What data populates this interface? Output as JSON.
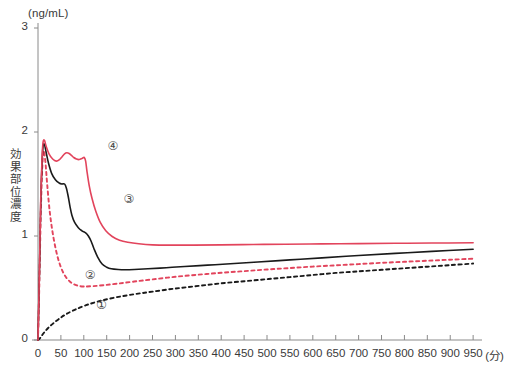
{
  "chart_data": {
    "type": "line",
    "title": "",
    "xlabel": "(分)",
    "ylabel": "効果部位濃度",
    "yunit": "(ng/mL)",
    "xlim": [
      0,
      965
    ],
    "ylim": [
      0,
      3
    ],
    "grid": false,
    "legend_position": "inline-annotations",
    "xticks": [
      0,
      50,
      100,
      150,
      200,
      250,
      300,
      350,
      400,
      450,
      500,
      550,
      600,
      650,
      700,
      750,
      800,
      850,
      900,
      950
    ],
    "xtick_labels": [
      "0",
      "50",
      "100",
      "150",
      "200",
      "250",
      "300",
      "350",
      "400",
      "450",
      "500",
      "550",
      "600",
      "650",
      "700",
      "750",
      "800",
      "850",
      "900",
      "950"
    ],
    "yticks": [
      0,
      1,
      2,
      3
    ],
    "ytick_labels": [
      "0",
      "1",
      "2",
      "3"
    ],
    "colors": {
      "red": "#e2445c",
      "black": "#1a1a1a",
      "axis": "#8a8a8a",
      "text": "#3a3a3a"
    },
    "series": [
      {
        "name": "1",
        "label": "①",
        "color": "#1a1a1a",
        "style": "dashed",
        "label_x": 140,
        "label_y": 0.33,
        "x": [
          0,
          4,
          8,
          14,
          22,
          32,
          45,
          60,
          80,
          105,
          135,
          170,
          210,
          250,
          300,
          350,
          400,
          450,
          500,
          550,
          600,
          650,
          700,
          750,
          800,
          850,
          900,
          950
        ],
        "y": [
          0.0,
          0.015,
          0.04,
          0.075,
          0.115,
          0.155,
          0.2,
          0.245,
          0.29,
          0.335,
          0.375,
          0.41,
          0.44,
          0.465,
          0.495,
          0.52,
          0.545,
          0.565,
          0.585,
          0.605,
          0.625,
          0.645,
          0.66,
          0.675,
          0.69,
          0.705,
          0.72,
          0.735
        ]
      },
      {
        "name": "2",
        "label": "②",
        "color": "#e2445c",
        "style": "dashed",
        "label_x": 115,
        "label_y": 0.62,
        "x": [
          0,
          3,
          6,
          9,
          12,
          16,
          20,
          26,
          34,
          44,
          56,
          70,
          85,
          100,
          120,
          145,
          175,
          210,
          250,
          300,
          350,
          400,
          450,
          500,
          550,
          600,
          650,
          700,
          750,
          800,
          850,
          900,
          950
        ],
        "y": [
          0.0,
          0.55,
          1.2,
          1.62,
          1.82,
          1.72,
          1.5,
          1.22,
          0.98,
          0.78,
          0.64,
          0.56,
          0.525,
          0.515,
          0.518,
          0.528,
          0.543,
          0.562,
          0.583,
          0.608,
          0.628,
          0.646,
          0.662,
          0.678,
          0.692,
          0.706,
          0.718,
          0.73,
          0.742,
          0.752,
          0.762,
          0.772,
          0.782
        ]
      },
      {
        "name": "3",
        "label": "③",
        "color": "#1a1a1a",
        "style": "solid",
        "label_x": 200,
        "label_y": 1.35,
        "x": [
          0,
          3,
          6,
          9,
          11,
          14,
          18,
          23,
          30,
          38,
          46,
          52,
          58,
          62,
          66,
          70,
          74,
          80,
          88,
          96,
          104,
          110,
          116,
          122,
          130,
          140,
          150,
          160,
          175,
          190,
          210,
          240,
          280,
          320,
          370,
          420,
          480,
          550,
          620,
          700,
          780,
          860,
          950
        ],
        "y": [
          0.0,
          0.62,
          1.32,
          1.72,
          1.86,
          1.88,
          1.8,
          1.7,
          1.6,
          1.54,
          1.51,
          1.5,
          1.5,
          1.46,
          1.38,
          1.28,
          1.2,
          1.13,
          1.08,
          1.05,
          1.03,
          1.0,
          0.95,
          0.88,
          0.8,
          0.73,
          0.7,
          0.685,
          0.678,
          0.676,
          0.678,
          0.685,
          0.695,
          0.707,
          0.72,
          0.733,
          0.75,
          0.77,
          0.79,
          0.812,
          0.833,
          0.852,
          0.872
        ]
      },
      {
        "name": "4",
        "label": "④",
        "color": "#e2445c",
        "style": "solid",
        "label_x": 165,
        "label_y": 1.86,
        "x": [
          0,
          3,
          6,
          9,
          11,
          14,
          18,
          24,
          32,
          40,
          47,
          53,
          58,
          63,
          68,
          73,
          78,
          84,
          90,
          96,
          101,
          104,
          107,
          112,
          118,
          126,
          136,
          148,
          162,
          178,
          196,
          220,
          250,
          290,
          340,
          400,
          470,
          540,
          620,
          700,
          780,
          860,
          950
        ],
        "y": [
          0.0,
          0.64,
          1.36,
          1.76,
          1.9,
          1.92,
          1.86,
          1.79,
          1.74,
          1.72,
          1.735,
          1.765,
          1.79,
          1.8,
          1.793,
          1.775,
          1.755,
          1.74,
          1.735,
          1.745,
          1.755,
          1.72,
          1.62,
          1.48,
          1.36,
          1.24,
          1.13,
          1.05,
          0.995,
          0.96,
          0.94,
          0.925,
          0.915,
          0.912,
          0.912,
          0.915,
          0.918,
          0.921,
          0.924,
          0.927,
          0.93,
          0.932,
          0.935
        ]
      }
    ]
  },
  "axes": {
    "y_unit_text": "(ng/mL)",
    "y_axis_title": "効果部位濃度",
    "x_unit_text": "(分)"
  }
}
